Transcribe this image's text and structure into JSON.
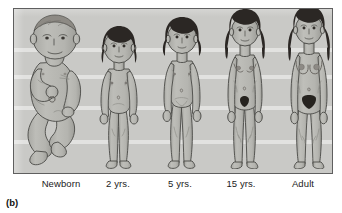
{
  "figure": {
    "panel_tag": "(b)",
    "caption_labels": [
      "Newborn",
      "2 yrs.",
      "5 yrs.",
      "15 yrs.",
      "Adult"
    ],
    "colors": {
      "page_background": "#ffffff",
      "panel_background": "#c9c9c6",
      "panel_border": "#5f5f5f",
      "skin_fill": "#b9b9b4",
      "skin_shadow": "#a3a39e",
      "outline": "#4a4a46",
      "hair_dark": "#2b2724",
      "hair_newborn": "#8d8a84",
      "pubic_hair": "#26231f",
      "band_highlight": "#ffffff",
      "label_text": "#1b1b1b"
    },
    "background_bands": [
      {
        "top": 39,
        "height": 4
      },
      {
        "top": 66,
        "height": 4
      },
      {
        "top": 97,
        "height": 4
      },
      {
        "top": 131,
        "height": 4
      }
    ],
    "subjects": [
      {
        "id": "newborn",
        "label": "Newborn",
        "stage": "newborn",
        "pose": "reclining-curled",
        "hair": "sparse-light",
        "breasts": "none",
        "pubic_hair": "none",
        "body_proportion": "large-head-chubby-torso",
        "column_center_x": 48,
        "figure_height_px": 152,
        "figure_width_px": 74
      },
      {
        "id": "2-yrs",
        "label": "2 yrs.",
        "stage": "toddler",
        "pose": "standing-front",
        "hair": "dark-short-bob",
        "breasts": "none",
        "pubic_hair": "none",
        "body_proportion": "rounded-belly-short-limbs",
        "column_center_x": 114,
        "figure_height_px": 142,
        "figure_width_px": 52
      },
      {
        "id": "5-yrs",
        "label": "5 yrs.",
        "stage": "child",
        "pose": "standing-front",
        "hair": "dark-short-bob",
        "breasts": "none",
        "pubic_hair": "none",
        "body_proportion": "slimmer-longer-limbs",
        "column_center_x": 175,
        "figure_height_px": 150,
        "figure_width_px": 52
      },
      {
        "id": "15-yrs",
        "label": "15 yrs.",
        "stage": "adolescent",
        "pose": "standing-front",
        "hair": "dark-long-wavy",
        "breasts": "developing",
        "pubic_hair": "present",
        "body_proportion": "slender-widening-hips",
        "column_center_x": 236,
        "figure_height_px": 156,
        "figure_width_px": 52
      },
      {
        "id": "adult",
        "label": "Adult",
        "stage": "adult",
        "pose": "standing-front",
        "hair": "dark-long-wavy",
        "breasts": "full",
        "pubic_hair": "present-triangle",
        "body_proportion": "mature-wide-hips",
        "column_center_x": 299,
        "figure_height_px": 158,
        "figure_width_px": 58
      }
    ]
  }
}
